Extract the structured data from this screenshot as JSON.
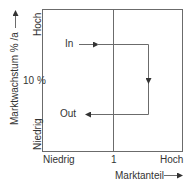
{
  "diagram": {
    "type": "portfolio-matrix-flow",
    "y_axis": {
      "label": "Marktwachstum % /a",
      "high": "Hoch",
      "low": "Niedrig",
      "mid_tick": "10 %"
    },
    "x_axis": {
      "label": "Marktanteil",
      "low": "Niedrig",
      "mid_tick": "1",
      "high": "Hoch"
    },
    "flow": {
      "start_label": "In",
      "end_label": "Out"
    },
    "colors": {
      "line": "#6b6b6b",
      "text": "#333333",
      "background": "#ffffff"
    }
  }
}
